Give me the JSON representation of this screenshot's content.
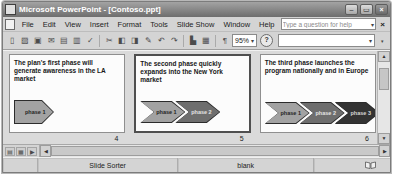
{
  "window": {
    "title": "Microsoft PowerPoint - [Contoso.ppt]"
  },
  "menu": {
    "items": [
      "File",
      "Edit",
      "View",
      "Insert",
      "Format",
      "Tools",
      "Slide Show",
      "Window",
      "Help"
    ],
    "ask_placeholder": "Type a question for help"
  },
  "toolbar": {
    "zoom_value": "95%"
  },
  "slides": [
    {
      "number": "4",
      "text": "The plan's first phase will generate awareness in the LA market",
      "phases": [
        {
          "label": "phase 1",
          "color": "#a2a2a2",
          "label_color": "#242424"
        }
      ]
    },
    {
      "number": "5",
      "text": "The second phase quickly expands into the New York market",
      "phases": [
        {
          "label": "phase 1",
          "color": "#a2a2a2",
          "label_color": "#242424"
        },
        {
          "label": "phase 2",
          "color": "#6e6e6e",
          "label_color": "#e4e4e4"
        }
      ]
    },
    {
      "number": "6",
      "text": "The third phase launches the program nationally and in Europe",
      "phases": [
        {
          "label": "phase 1",
          "color": "#a2a2a2",
          "label_color": "#242424"
        },
        {
          "label": "phase 2",
          "color": "#6e6e6e",
          "label_color": "#e4e4e4"
        },
        {
          "label": "phase 3",
          "color": "#333333",
          "label_color": "#d6d6d6"
        }
      ]
    }
  ],
  "statusbar": {
    "view_label": "Slide Sorter",
    "template_name": "blank"
  },
  "colors": {
    "titlebar": "#7a7a7a",
    "chrome": "#d4d4d4",
    "sorter_background": "#dadada",
    "selection_border": "#4f4f4f"
  },
  "icons": {
    "minimize": "–",
    "restore": "▭",
    "close": "×",
    "dropdown": "▾",
    "new": "▯",
    "open": "▨",
    "save": "▣",
    "email": "✉",
    "print": "▤",
    "preview": "▥",
    "spelling": "✓",
    "cut": "✂",
    "copy": "◧",
    "paste": "◨",
    "format_painter": "✎",
    "undo": "↶",
    "redo": "↷",
    "chart": "▙",
    "table": "▦",
    "formatting": "¶",
    "help": "?",
    "scroll_up": "▲",
    "scroll_down": "▼",
    "scroll_left": "◀",
    "scroll_right": "▶",
    "toolbar_options": "▾",
    "view_normal": "▤",
    "view_sorter": "▦",
    "view_show": "▶"
  }
}
